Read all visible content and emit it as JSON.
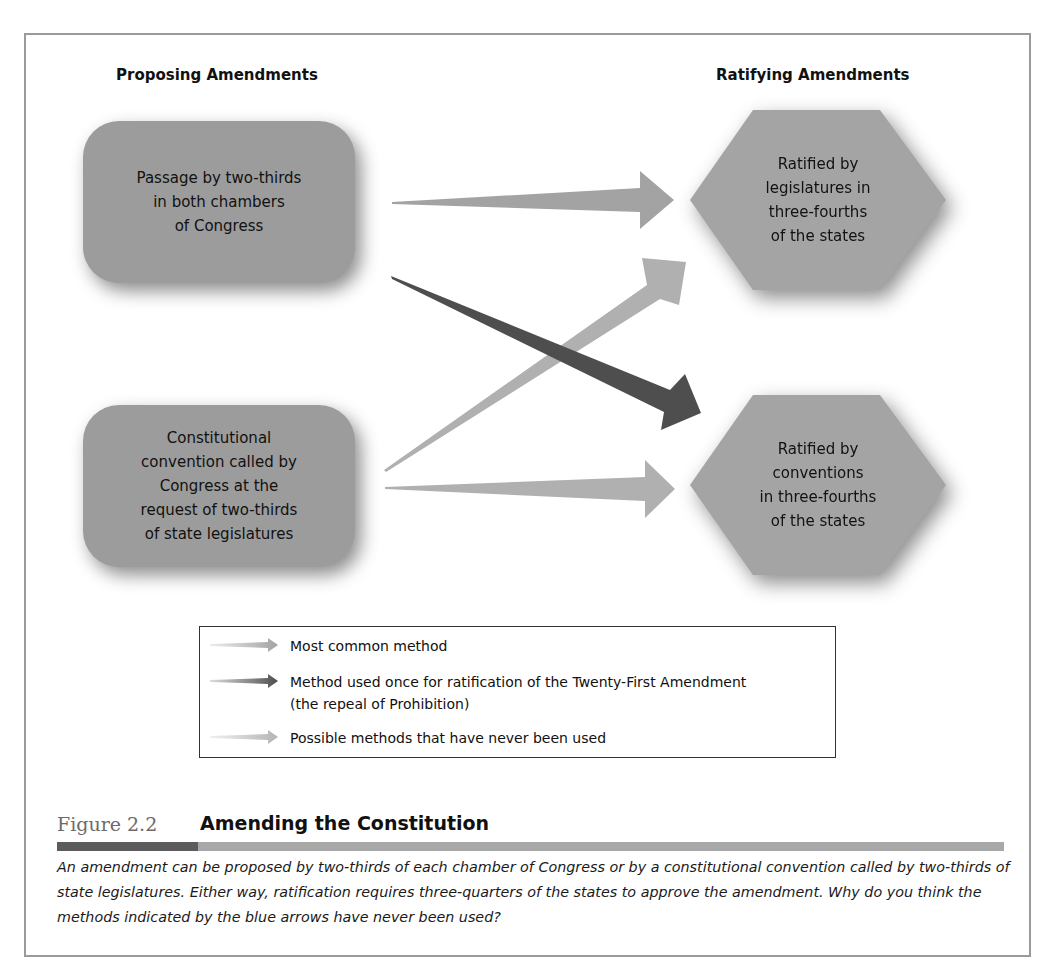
{
  "figure": {
    "number": "Figure 2.2",
    "title": "Amending the Constitution",
    "caption": "An amendment can be proposed by two-thirds of each chamber of Congress or by a constitutional convention called by two-thirds of state legislatures. Either way, ratification requires three-quarters of the states to approve the amendment. Why do you think the methods indicated by the blue arrows have never been used?",
    "bar_colors": {
      "dark": "#5c5c5c",
      "light": "#a8a8a8"
    }
  },
  "columns": {
    "proposing": "Proposing Amendments",
    "ratifying": "Ratifying Amendments"
  },
  "proposing_boxes": [
    {
      "label": "Passage by two-thirds in both chambers of Congress",
      "lines": [
        "Passage by two-thirds",
        "in both chambers",
        "of Congress"
      ]
    },
    {
      "label": "Constitutional convention called by Congress at the request of two-thirds of state legislatures",
      "lines": [
        "Constitutional",
        "convention called by",
        "Congress at the",
        "request of two-thirds",
        "of state legislatures"
      ]
    }
  ],
  "ratifying_boxes": [
    {
      "label": "Ratified by legislatures in three-fourths of the states",
      "lines": [
        "Ratified by",
        "legislatures in",
        "three-fourths",
        "of the states"
      ]
    },
    {
      "label": "Ratified by conventions in three-fourths of the states",
      "lines": [
        "Ratified by",
        "conventions",
        "in three-fourths",
        "of the states"
      ]
    }
  ],
  "arrows": [
    {
      "from": "Passage by two-thirds in both chambers of Congress",
      "to": "Ratified by legislatures in three-fourths of the states",
      "type": "most_common",
      "color": "#a3a3a3"
    },
    {
      "from": "Passage by two-thirds in both chambers of Congress",
      "to": "Ratified by conventions in three-fourths of the states",
      "type": "used_once",
      "color": "#4e4e4e"
    },
    {
      "from": "Constitutional convention",
      "to": "Ratified by legislatures in three-fourths of the states",
      "type": "never_used",
      "color": "#b0b0b0"
    },
    {
      "from": "Constitutional convention",
      "to": "Ratified by conventions in three-fourths of the states",
      "type": "never_used",
      "color": "#b0b0b0"
    }
  ],
  "legend": {
    "items": [
      {
        "label": "Most common method",
        "color": "#a3a3a3"
      },
      {
        "label": "Method used once for ratification of the Twenty-First Amendment",
        "label2": "(the repeal of Prohibition)",
        "color": "#4e4e4e"
      },
      {
        "label": "Possible methods that have never been used",
        "color": "#b5b5b5"
      }
    ]
  }
}
